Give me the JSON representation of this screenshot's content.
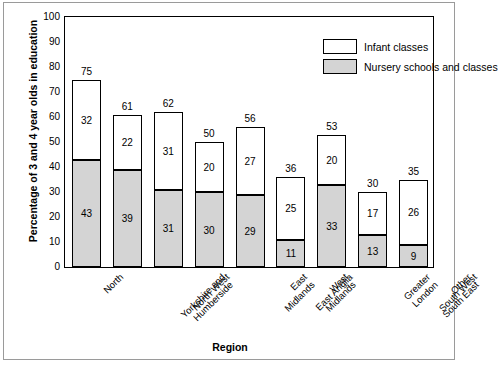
{
  "chart_data": {
    "type": "bar",
    "subtype": "stacked",
    "title": "",
    "xlabel": "Region",
    "ylabel": "Percentage of 3 and 4 year olds in education",
    "ylim": [
      0,
      100
    ],
    "ytick_step": 10,
    "yticks": [
      "0",
      "10",
      "20",
      "30",
      "40",
      "50",
      "60",
      "70",
      "80",
      "90",
      "100"
    ],
    "grid": false,
    "legend_position": "top-right",
    "categories": [
      "North",
      "Yorkshire and Humberside",
      "North West",
      "East Midlands",
      "West Midlands",
      "East Anglia",
      "Greater London",
      "Other South East",
      "South West"
    ],
    "series": [
      {
        "name": "Nursery schools and classes",
        "color": "#d4d4d4",
        "values": [
          43,
          39,
          31,
          30,
          29,
          11,
          33,
          13,
          9
        ]
      },
      {
        "name": "Infant classes",
        "color": "#ffffff",
        "values": [
          32,
          22,
          31,
          20,
          27,
          25,
          20,
          17,
          26
        ]
      }
    ],
    "totals": [
      75,
      61,
      62,
      50,
      56,
      36,
      53,
      30,
      35
    ]
  },
  "legend": {
    "items": [
      {
        "label": "Infant classes",
        "swatch": "infant"
      },
      {
        "label": "Nursery schools and classes",
        "swatch": "nursery"
      }
    ]
  }
}
